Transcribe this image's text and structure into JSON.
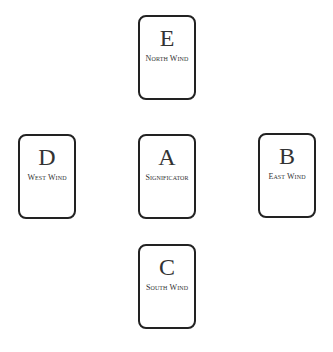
{
  "diagram": {
    "type": "tarot-spread",
    "cards": [
      {
        "letter": "E",
        "label": "North Wind",
        "position": "top"
      },
      {
        "letter": "D",
        "label": "West Wind",
        "position": "left"
      },
      {
        "letter": "A",
        "label": "Significator",
        "position": "center"
      },
      {
        "letter": "B",
        "label": "East Wind",
        "position": "right"
      },
      {
        "letter": "C",
        "label": "South Wind",
        "position": "bottom"
      }
    ]
  }
}
